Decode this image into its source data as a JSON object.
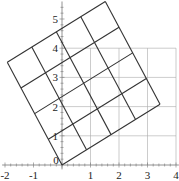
{
  "chart_data": {
    "type": "line",
    "title": "",
    "xlabel": "",
    "ylabel": "",
    "xlim": [
      -2.1,
      4.1
    ],
    "ylim": [
      -0.5,
      5.6
    ],
    "x_ticks": [
      "-2",
      "-1",
      "0",
      "1",
      "2",
      "3",
      "4"
    ],
    "y_ticks": [
      "1",
      "2",
      "3",
      "4",
      "5"
    ],
    "grid": {
      "name": "unit grid",
      "x_range": [
        0,
        4
      ],
      "y_range": [
        0,
        4
      ],
      "step": 1,
      "color": "#aaaaaa"
    },
    "rotated_grid": {
      "name": "rotated 4x4 grid",
      "origin": [
        0,
        0
      ],
      "u_vector": [
        0.86,
        0.52
      ],
      "v_vector": [
        -0.48,
        0.88
      ],
      "cells": 4,
      "corners": [
        [
          0,
          0
        ],
        [
          3.44,
          2.07
        ],
        [
          1.46,
          5.61
        ],
        [
          -1.93,
          3.54
        ]
      ],
      "color": "#333333"
    }
  }
}
